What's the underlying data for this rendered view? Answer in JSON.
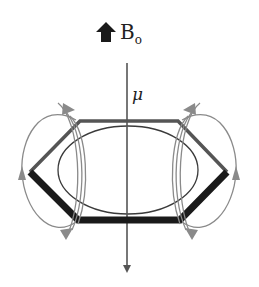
{
  "diagram": {
    "field_label": {
      "main": "B",
      "subscript": "o"
    },
    "moment_label": "μ",
    "elements": {
      "field_arrow": "upward-block-arrow-icon",
      "moment_axis": "vertical-arrow-down",
      "ring": "hexagon-benzene-ring",
      "current_loop": "ellipse",
      "induced_field_lines": "curved-field-lines-left-and-right"
    },
    "colors": {
      "ring_front": "#1a1a1a",
      "ring_back": "#555555",
      "ellipse": "#3a3a3a",
      "field_lines": "#8a8a8a",
      "axis": "#555555"
    }
  }
}
